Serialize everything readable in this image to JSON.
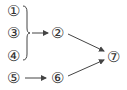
{
  "diagram": {
    "nodes": [
      {
        "id": "1",
        "label": "①",
        "x": 13,
        "y": 11
      },
      {
        "id": "3",
        "label": "③",
        "x": 13,
        "y": 33
      },
      {
        "id": "4",
        "label": "④",
        "x": 13,
        "y": 56
      },
      {
        "id": "2",
        "label": "②",
        "x": 57,
        "y": 33
      },
      {
        "id": "5",
        "label": "⑤",
        "x": 13,
        "y": 78
      },
      {
        "id": "6",
        "label": "⑥",
        "x": 57,
        "y": 78
      },
      {
        "id": "7",
        "label": "⑦",
        "x": 113,
        "y": 57
      }
    ],
    "edges": [
      {
        "from": "group(1,3,4)",
        "to": "2"
      },
      {
        "from": "2",
        "to": "7"
      },
      {
        "from": "5",
        "to": "6"
      },
      {
        "from": "6",
        "to": "7"
      }
    ],
    "stroke_color": "#444444"
  }
}
